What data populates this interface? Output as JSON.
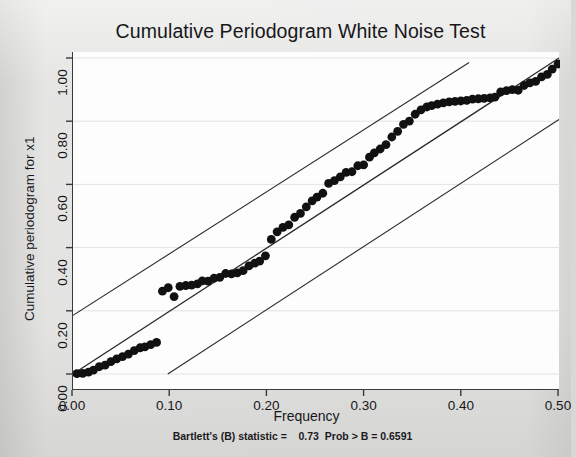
{
  "chart_data": {
    "type": "scatter",
    "title": "Cumulative Periodogram White Noise Test",
    "xlabel": "Frequency",
    "ylabel": "Cumulative periodogram for x1",
    "xlim": [
      0.0,
      0.5
    ],
    "ylim": [
      0.0,
      1.0
    ],
    "xticks": [
      "0.00",
      "0.10",
      "0.20",
      "0.30",
      "0.40",
      "0.50"
    ],
    "xtick_values": [
      0.0,
      0.1,
      0.2,
      0.3,
      0.4,
      0.5
    ],
    "yticks": [
      "0.00",
      "0.20",
      "0.40",
      "0.60",
      "0.80",
      "1.00"
    ],
    "ytick_values": [
      0.0,
      0.2,
      0.4,
      0.6,
      0.8,
      1.0
    ],
    "grid": "horizontal",
    "legend": "none",
    "annotation": "Bartlett's (B) statistic =    0.73  Prob > B = 0.6591",
    "marker_color": "#111111",
    "line_color": "#2a2a2a",
    "plot_background": "#fdfdfd",
    "page_background": "#dddddb",
    "series": [
      {
        "name": "Cumulative periodogram",
        "type": "scatter",
        "x": [
          0.004,
          0.01,
          0.016,
          0.021,
          0.027,
          0.033,
          0.039,
          0.045,
          0.051,
          0.057,
          0.063,
          0.069,
          0.074,
          0.08,
          0.086,
          0.092,
          0.098,
          0.104,
          0.11,
          0.116,
          0.122,
          0.128,
          0.133,
          0.139,
          0.145,
          0.151,
          0.157,
          0.163,
          0.169,
          0.175,
          0.181,
          0.187,
          0.192,
          0.198,
          0.204,
          0.21,
          0.216,
          0.222,
          0.228,
          0.234,
          0.24,
          0.246,
          0.251,
          0.257,
          0.263,
          0.269,
          0.275,
          0.281,
          0.287,
          0.293,
          0.299,
          0.305,
          0.31,
          0.316,
          0.322,
          0.328,
          0.334,
          0.34,
          0.346,
          0.352,
          0.358,
          0.364,
          0.369,
          0.375,
          0.381,
          0.387,
          0.393,
          0.399,
          0.405,
          0.411,
          0.417,
          0.423,
          0.429,
          0.434,
          0.44,
          0.446,
          0.452,
          0.458,
          0.464,
          0.47,
          0.476,
          0.482,
          0.488,
          0.493,
          0.499
        ],
        "y": [
          0.001,
          0.002,
          0.006,
          0.012,
          0.023,
          0.028,
          0.039,
          0.048,
          0.055,
          0.063,
          0.074,
          0.083,
          0.086,
          0.093,
          0.1,
          0.262,
          0.273,
          0.245,
          0.277,
          0.28,
          0.281,
          0.285,
          0.295,
          0.294,
          0.303,
          0.306,
          0.318,
          0.317,
          0.32,
          0.327,
          0.342,
          0.351,
          0.357,
          0.374,
          0.426,
          0.45,
          0.464,
          0.472,
          0.496,
          0.508,
          0.529,
          0.548,
          0.56,
          0.572,
          0.603,
          0.612,
          0.624,
          0.638,
          0.64,
          0.659,
          0.662,
          0.686,
          0.7,
          0.712,
          0.726,
          0.75,
          0.768,
          0.79,
          0.8,
          0.822,
          0.836,
          0.845,
          0.849,
          0.854,
          0.858,
          0.861,
          0.863,
          0.864,
          0.866,
          0.87,
          0.871,
          0.872,
          0.874,
          0.876,
          0.893,
          0.897,
          0.9,
          0.898,
          0.913,
          0.921,
          0.926,
          0.94,
          0.948,
          0.965,
          0.981
        ]
      },
      {
        "name": "45-degree reference line",
        "type": "line",
        "x": [
          0.0,
          0.5
        ],
        "y": [
          0.0,
          1.0
        ]
      },
      {
        "name": "Upper confidence band",
        "type": "line",
        "x": [
          0.0,
          0.4075
        ],
        "y": [
          0.1855,
          0.9855
        ]
      },
      {
        "name": "Lower confidence band",
        "type": "line",
        "x": [
          0.0975,
          0.5
        ],
        "y": [
          0.0,
          0.8055
        ]
      }
    ]
  },
  "chart": {
    "title": "Cumulative Periodogram White Noise Test",
    "xlabel": "Frequency",
    "ylabel": "Cumulative periodogram for x1",
    "footnote": "Bartlett's (B) statistic =    0.73  Prob > B = 0.6591"
  }
}
